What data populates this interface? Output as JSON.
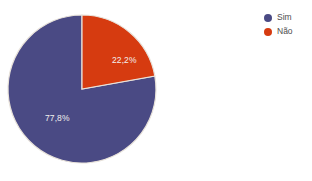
{
  "chart_data": {
    "type": "pie",
    "title": "",
    "xlabel": "",
    "ylabel": "",
    "categories": [
      "Sim",
      "Não"
    ],
    "values": [
      77.8,
      22.2
    ],
    "value_labels": [
      "77,8%",
      "22,2%"
    ],
    "colors": [
      "#4a4a84",
      "#d63b10"
    ],
    "start_angle_deg": 0,
    "direction": "clockwise",
    "legend_position": "right",
    "grid": false,
    "slices": [
      {
        "name": "Sim",
        "value": 77.8,
        "label": "77,8%",
        "color": "#4a4a84",
        "start_deg": 79.9,
        "end_deg": 360
      },
      {
        "name": "Não",
        "value": 22.2,
        "label": "22,2%",
        "color": "#d63b10",
        "start_deg": 0,
        "end_deg": 79.9
      }
    ]
  },
  "legend": {
    "items": [
      {
        "label": "Sim",
        "color": "#4a4a84",
        "swatch": "circle-marker-icon"
      },
      {
        "label": "Não",
        "color": "#d63b10",
        "swatch": "circle-marker-icon"
      }
    ]
  },
  "geometry": {
    "center_x": 82,
    "center_y": 89,
    "radius": 74,
    "label_sim_x": 45,
    "label_sim_y": 121,
    "label_nao_x": 112,
    "label_nao_y": 63
  },
  "style": {
    "background": "#ffffff",
    "slice_stroke": "#e8e2da",
    "label_text_color": "#f2f0ee",
    "legend_text_color": "#4d4d4d"
  }
}
